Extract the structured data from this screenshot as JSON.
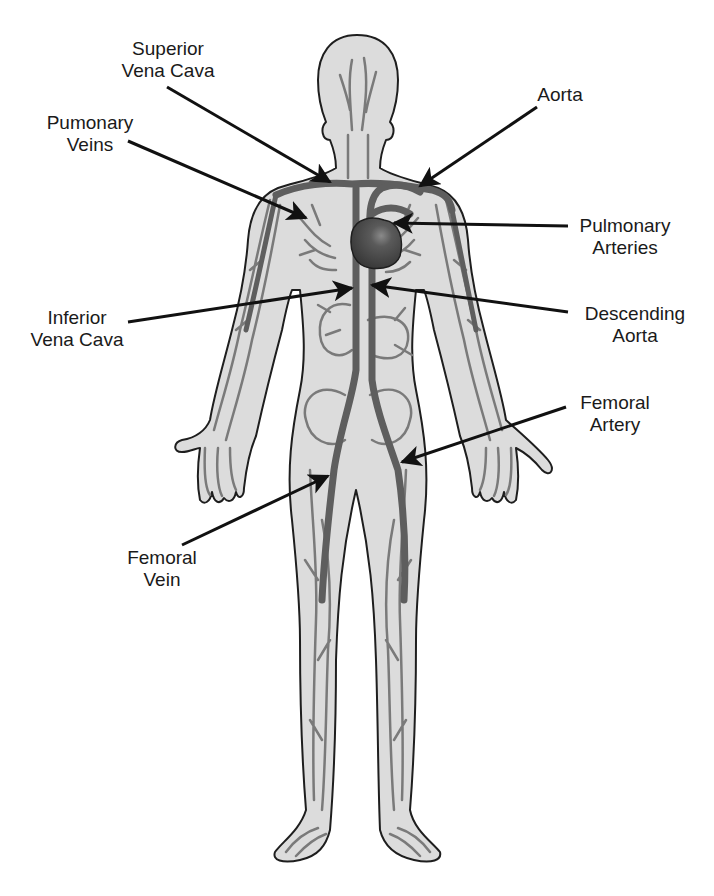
{
  "diagram": {
    "colors": {
      "background": "#ffffff",
      "body_fill": "#dcdcdc",
      "outline": "#1e1e1e",
      "vessel": "#7a7a7a",
      "major_vessel": "#5e5e5e",
      "heart": "#4a4a4a",
      "arrow": "#111111",
      "text": "#1a1a1a"
    },
    "labels": [
      {
        "id": "superior-vena-cava",
        "line1": "Superior",
        "line2": "Vena Cava",
        "side": "left"
      },
      {
        "id": "pumonary-veins",
        "line1": "Pumonary",
        "line2": "Veins",
        "side": "left"
      },
      {
        "id": "aorta",
        "line1": "Aorta",
        "line2": "",
        "side": "right"
      },
      {
        "id": "pulmonary-arteries",
        "line1": "Pulmonary",
        "line2": "Arteries",
        "side": "right"
      },
      {
        "id": "inferior-vena-cava",
        "line1": "Inferior",
        "line2": "Vena Cava",
        "side": "left"
      },
      {
        "id": "descending-aorta",
        "line1": "Descending",
        "line2": "Aorta",
        "side": "right"
      },
      {
        "id": "femoral-artery",
        "line1": "Femoral",
        "line2": "Artery",
        "side": "right"
      },
      {
        "id": "femoral-vein",
        "line1": "Femoral",
        "line2": "Vein",
        "side": "left"
      }
    ]
  }
}
